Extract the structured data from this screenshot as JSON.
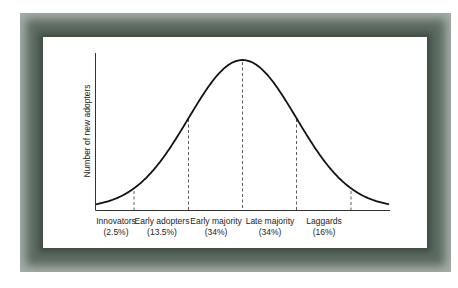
{
  "frame": {
    "outer_color": "#a4aea7",
    "inner_color": "#4f5f55",
    "panel_color": "#ffffff"
  },
  "chart_data": {
    "type": "line",
    "title": "",
    "subtitle": "",
    "xlabel": "",
    "ylabel": "Number of new adopters",
    "grid": false,
    "legend": null,
    "categories": [
      {
        "label": "Innovators",
        "share": "(2.5%)",
        "value": 2.5
      },
      {
        "label": "Early adopters",
        "share": "(13.5%)",
        "value": 13.5
      },
      {
        "label": "Early majority",
        "share": "(34%)",
        "value": 34
      },
      {
        "label": "Late majority",
        "share": "(34%)",
        "value": 34
      },
      {
        "label": "Laggards",
        "share": "(16%)",
        "value": 16
      }
    ],
    "dividers_sd": [
      -2,
      -1,
      0,
      1,
      2
    ],
    "curve": {
      "x_sd": [
        -2.9,
        -2.5,
        -2,
        -1.5,
        -1,
        -0.5,
        0,
        0.5,
        1,
        1.5,
        2,
        2.5,
        2.9
      ],
      "y_relative": [
        0.015,
        0.044,
        0.135,
        0.325,
        0.607,
        0.882,
        1.0,
        0.882,
        0.607,
        0.325,
        0.135,
        0.044,
        0.015
      ]
    }
  }
}
